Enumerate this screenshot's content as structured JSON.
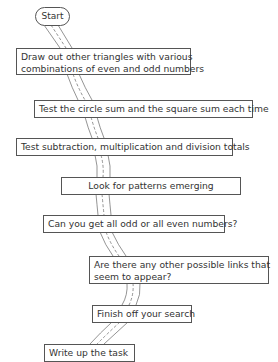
{
  "diagram": {
    "type": "flowchart",
    "style": "road-path connectors",
    "start": {
      "label": "Start"
    },
    "steps": [
      {
        "id": 1,
        "lines": [
          "Draw out  other triangles with various",
          "combinations of even and odd numbers"
        ]
      },
      {
        "id": 2,
        "lines": [
          "Test the circle sum and the square sum each time"
        ]
      },
      {
        "id": 3,
        "lines": [
          "Test subtraction, multiplication and division totals"
        ]
      },
      {
        "id": 4,
        "lines": [
          "Look for patterns emerging"
        ]
      },
      {
        "id": 5,
        "lines": [
          "Can you get all odd or all even numbers?"
        ]
      },
      {
        "id": 6,
        "lines": [
          "Are there any other possible links that",
          "seem to appear?"
        ]
      },
      {
        "id": 7,
        "lines": [
          "Finish off your search"
        ]
      },
      {
        "id": 8,
        "lines": [
          "Write up the task"
        ]
      }
    ]
  }
}
